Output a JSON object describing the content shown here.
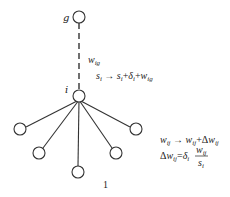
{
  "diagram": {
    "type": "tree",
    "nodes": {
      "g": {
        "label": "g",
        "x": 79,
        "y": 17
      },
      "i": {
        "label": "i",
        "x": 79,
        "y": 96
      },
      "children": [
        {
          "x": 20,
          "y": 129
        },
        {
          "x": 39,
          "y": 153
        },
        {
          "x": 78,
          "y": 172
        },
        {
          "x": 116,
          "y": 153
        },
        {
          "x": 136,
          "y": 129
        }
      ]
    },
    "edge_label": "w_ig",
    "equations": {
      "s_update": "s_i → s_i + δ_i + w_ig",
      "w_update": "w_ij → w_ij + Δw_ij",
      "delta_w": "Δw_ij = δ_i · w_ij / s_i"
    },
    "figure_number": "1"
  }
}
